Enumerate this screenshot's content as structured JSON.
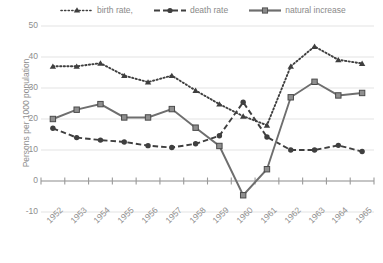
{
  "chart_data": {
    "type": "line",
    "title": "",
    "xlabel": "",
    "ylabel": "Persons per 1000 population",
    "categories": [
      "1952",
      "1953",
      "1954",
      "1955",
      "1956",
      "1957",
      "1958",
      "1959",
      "1960",
      "1961",
      "1962",
      "1963",
      "1964",
      "1965"
    ],
    "ylim": [
      -10,
      50
    ],
    "ytick_labels": [
      "50",
      "40",
      "30",
      "20",
      "10",
      "0",
      "-10"
    ],
    "ytick_values": [
      50,
      40,
      30,
      20,
      10,
      0,
      -10
    ],
    "grid": true,
    "legend_position": "top",
    "series": [
      {
        "name": "birth rate,",
        "marker": "triangle",
        "line_style": "dotted",
        "color": "#3f3f3f",
        "values": [
          37.0,
          37.0,
          38.0,
          34.0,
          31.9,
          34.0,
          29.2,
          24.8,
          20.9,
          18.0,
          37.0,
          43.4,
          39.1,
          37.9
        ]
      },
      {
        "name": "death rate",
        "marker": "circle",
        "line_style": "dashed",
        "color": "#3f3f3f",
        "values": [
          17.0,
          14.0,
          13.2,
          12.6,
          11.4,
          10.8,
          12.0,
          14.6,
          25.4,
          14.2,
          10.0,
          10.0,
          11.5,
          9.5
        ]
      },
      {
        "name": "natural increase",
        "marker": "square",
        "line_style": "solid",
        "color": "#6e6e6e",
        "values": [
          20.0,
          23.0,
          24.8,
          20.5,
          20.5,
          23.2,
          17.2,
          11.3,
          -4.6,
          3.8,
          27.0,
          32.0,
          27.6,
          28.4
        ]
      }
    ]
  },
  "axes": {
    "y_title": "Persons per 1000 population"
  },
  "colors": {
    "gridline": "#e3e3e3",
    "axis_text": "#8e8e8e",
    "series_dark": "#3f3f3f",
    "series_gray": "#6e6e6e",
    "background": "#ffffff"
  }
}
